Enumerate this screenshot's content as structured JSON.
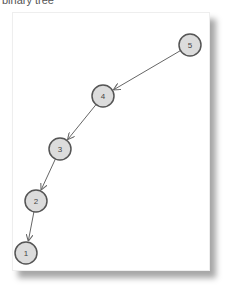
{
  "title": "binary tree",
  "colors": {
    "node_fill": "#dcdcdc",
    "node_stroke": "#555555",
    "edge": "#666666",
    "background": "#ffffff"
  },
  "nodes": [
    {
      "id": "5",
      "label": "5",
      "x": 190,
      "y": 45
    },
    {
      "id": "4",
      "label": "4",
      "x": 103,
      "y": 96
    },
    {
      "id": "3",
      "label": "3",
      "x": 60,
      "y": 149
    },
    {
      "id": "2",
      "label": "2",
      "x": 36,
      "y": 201
    },
    {
      "id": "1",
      "label": "1",
      "x": 26,
      "y": 253
    }
  ],
  "edges": [
    {
      "from": "5",
      "to": "4"
    },
    {
      "from": "4",
      "to": "3"
    },
    {
      "from": "3",
      "to": "2"
    },
    {
      "from": "2",
      "to": "1"
    }
  ]
}
